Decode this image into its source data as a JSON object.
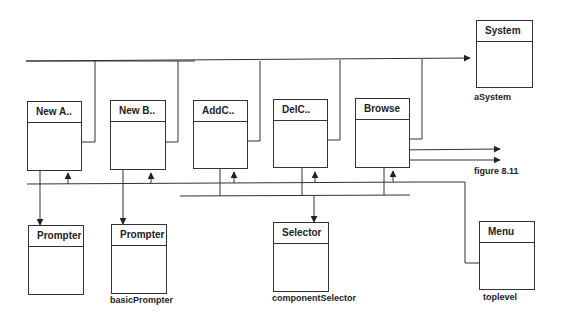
{
  "objects": {
    "newA": {
      "title": "New A.."
    },
    "newB": {
      "title": "New B.."
    },
    "addC": {
      "title": "AddC.."
    },
    "delC": {
      "title": "DelC.."
    },
    "browse": {
      "title": "Browse"
    },
    "system": {
      "title": "System",
      "name": "aSystem"
    },
    "prompter1": {
      "title": "Prompter"
    },
    "prompter2": {
      "title": "Prompter",
      "name": "basicPrompter"
    },
    "selector": {
      "title": "Selector",
      "name": "componentSelector"
    },
    "menu": {
      "title": "Menu",
      "name": "toplevel"
    }
  },
  "annotations": {
    "figure_ref": "figure 8.11"
  }
}
